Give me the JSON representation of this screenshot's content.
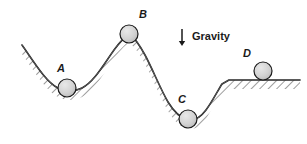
{
  "figure": {
    "background_color": "#ffffff",
    "width": 307,
    "height": 144
  },
  "annotation": {
    "gravity_label": "Gravity",
    "gravity_arrow_icon": "arrow-down-icon",
    "gravity_label_x": 192,
    "gravity_label_y": 31,
    "gravity_arrow_x": 182,
    "gravity_arrow_y_top": 29,
    "gravity_arrow_y_bottom": 46
  },
  "terrain": {
    "stroke_color": "#1a1a1a",
    "hatch_color": "#4d4d4d",
    "surface_path": "M 22,45 C 34,62 46,82 58,88 C 66,92 74,92 82,88 C 94,82 104,64 114,50 C 120,42 124,37 129,34 C 134,37 139,44 145,55 C 153,70 160,88 168,102 C 174,112 180,118 188,120 C 194,121 200,118 206,110 C 212,102 217,92 222,84 L 229,80 L 300,80",
    "hatch_band_width": 9
  },
  "balls": [
    {
      "id": "ball-a",
      "label": "A",
      "cx": 67,
      "cy": 88,
      "r": 9,
      "label_x": 57,
      "label_y": 63,
      "fill": "#d4d4d4",
      "stroke": "#1a1a1a"
    },
    {
      "id": "ball-b",
      "label": "B",
      "cx": 129,
      "cy": 34,
      "r": 9,
      "label_x": 139,
      "label_y": 9,
      "fill": "#d4d4d4",
      "stroke": "#1a1a1a"
    },
    {
      "id": "ball-c",
      "label": "C",
      "cx": 188,
      "cy": 119,
      "r": 9,
      "label_x": 178,
      "label_y": 94,
      "fill": "#d4d4d4",
      "stroke": "#1a1a1a"
    },
    {
      "id": "ball-d",
      "label": "D",
      "cx": 263,
      "cy": 71,
      "r": 9,
      "label_x": 243,
      "label_y": 48,
      "fill": "#d4d4d4",
      "stroke": "#1a1a1a"
    }
  ]
}
